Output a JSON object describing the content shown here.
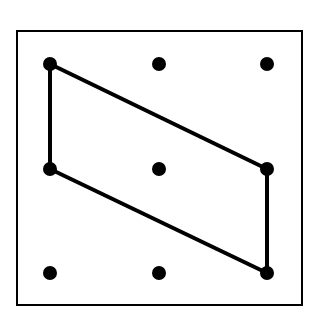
{
  "diagram": {
    "type": "dot-grid-shape",
    "frame": {
      "x": 17,
      "y": 31,
      "width": 285,
      "height": 274
    },
    "grid": {
      "cols": 3,
      "rows": 3
    },
    "dots": [
      {
        "x": 50,
        "y": 64
      },
      {
        "x": 159,
        "y": 64
      },
      {
        "x": 267,
        "y": 64
      },
      {
        "x": 50,
        "y": 169
      },
      {
        "x": 159,
        "y": 169
      },
      {
        "x": 267,
        "y": 169
      },
      {
        "x": 50,
        "y": 273
      },
      {
        "x": 159,
        "y": 273
      },
      {
        "x": 267,
        "y": 273
      }
    ],
    "shape": {
      "name": "parallelogram",
      "vertices": [
        {
          "x": 50,
          "y": 64
        },
        {
          "x": 267,
          "y": 169
        },
        {
          "x": 267,
          "y": 273
        },
        {
          "x": 50,
          "y": 169
        }
      ]
    },
    "colors": {
      "line": "#000000",
      "background": "#ffffff"
    }
  }
}
